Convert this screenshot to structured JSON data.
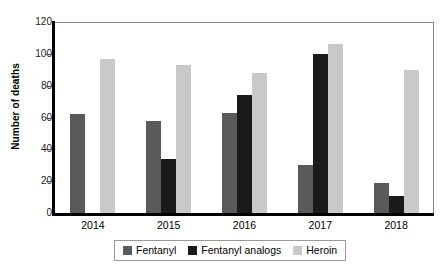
{
  "chart_data": {
    "type": "bar",
    "title": "",
    "subtitle": "",
    "xlabel": "",
    "ylabel": "Number of deaths",
    "categories": [
      "2014",
      "2015",
      "2016",
      "2017",
      "2018"
    ],
    "series": [
      {
        "name": "Fentanyl",
        "color": "#5a5a5a",
        "values": [
          62,
          58,
          63,
          30,
          19
        ]
      },
      {
        "name": "Fentanyl analogs",
        "color": "#1a1a1a",
        "values": [
          0,
          34,
          74,
          100,
          11
        ]
      },
      {
        "name": "Heroin",
        "color": "#c9c9c9",
        "values": [
          97,
          93,
          88,
          106,
          90
        ]
      }
    ],
    "ylim": [
      0,
      120
    ],
    "yticks": [
      0,
      20,
      40,
      60,
      80,
      100,
      120
    ],
    "ytick_labels": [
      "0",
      "20",
      "40",
      "60",
      "80",
      "100",
      "120"
    ],
    "grid": false,
    "legend_position": "bottom",
    "axis_color": "#000000",
    "frame_color": "#8c8c8c",
    "background": "#ffffff"
  },
  "legend": {
    "entries": [
      {
        "label": "Fentanyl",
        "color": "#5a5a5a"
      },
      {
        "label": "Fentanyl analogs",
        "color": "#1a1a1a"
      },
      {
        "label": "Heroin",
        "color": "#c9c9c9"
      }
    ]
  }
}
